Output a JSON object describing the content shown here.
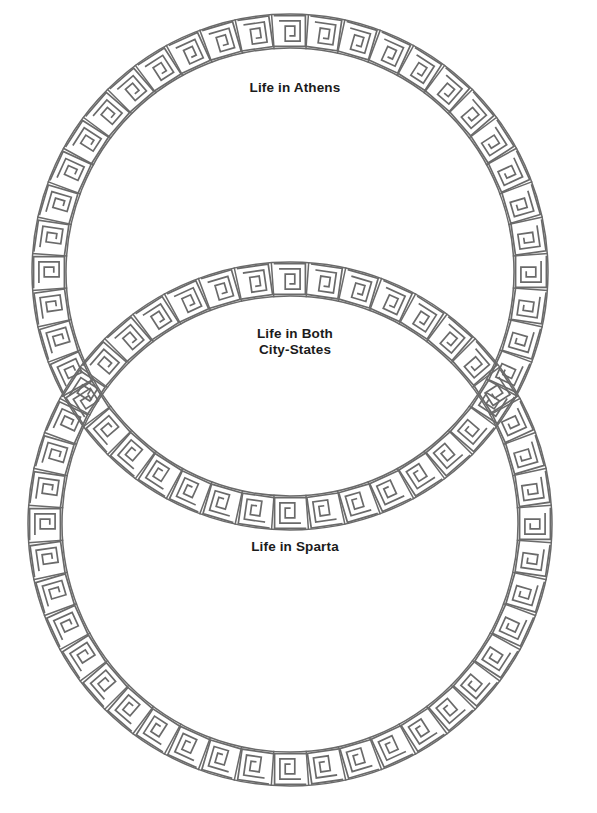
{
  "document": {
    "type": "venn-diagram-worksheet",
    "title": "Life in Athens and Sparta Venn Diagram",
    "background_color": "#ffffff",
    "ink_color": "#6a6a6a",
    "text_color": "#1b1b1b"
  },
  "diagram": {
    "kind": "venn",
    "circle_count": 2,
    "border_style": "greek-key-meander",
    "circles": [
      {
        "id": "athens",
        "label": "Life in Athens",
        "label_lines": [
          "Life in Athens"
        ],
        "center_x": 290,
        "center_y": 272,
        "outer_radius": 258,
        "inner_radius": 224
      },
      {
        "id": "sparta",
        "label": "Life in Sparta",
        "label_lines": [
          "Life in Sparta"
        ],
        "center_x": 290,
        "center_y": 524,
        "outer_radius": 262,
        "inner_radius": 228
      }
    ],
    "intersection": {
      "id": "both",
      "label": "Life in Both City-States",
      "label_lines": [
        "Life in Both",
        "City-States"
      ]
    }
  },
  "labels": {
    "athens": "Life in Athens",
    "both": "Life in Both\nCity-States",
    "sparta": "Life in Sparta"
  }
}
